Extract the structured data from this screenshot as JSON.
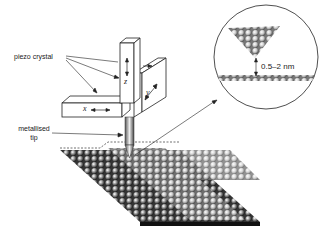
{
  "diagram": {
    "labels": {
      "piezo": "piezo crystal",
      "tip_line1": "metallised",
      "tip_line2": "tip",
      "gap": "0.5–2 nm"
    },
    "axes": {
      "x": "x",
      "y": "y",
      "z": "z"
    },
    "colors": {
      "line": "#222222",
      "background": "#ffffff",
      "atom_dark": "#2a2a2a",
      "atom_light": "#e6e6e6"
    }
  }
}
